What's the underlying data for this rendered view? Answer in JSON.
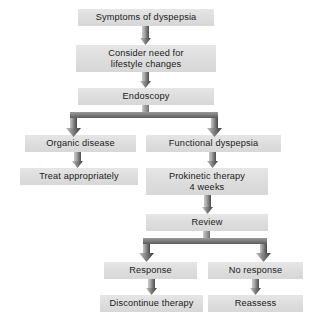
{
  "diagram": {
    "background_color": "#ffffff",
    "node_fill_color": "#dedede",
    "connector_color": "#6e6e6e",
    "text_color": "#1b1b1b",
    "nodes": [
      {
        "id": "symptoms",
        "label": "Symptoms of dyspepsia",
        "x": 78,
        "y": 9,
        "w": 136,
        "h": 17
      },
      {
        "id": "lifestyle",
        "label": "Consider need for\nlifestyle changes",
        "x": 76,
        "y": 45,
        "w": 140,
        "h": 27
      },
      {
        "id": "endoscopy",
        "label": "Endoscopy",
        "x": 78,
        "y": 88,
        "w": 136,
        "h": 17
      },
      {
        "id": "organic",
        "label": "Organic disease",
        "x": 25,
        "y": 135,
        "w": 111,
        "h": 17
      },
      {
        "id": "functional",
        "label": "Functional dyspepsia",
        "x": 146,
        "y": 135,
        "w": 135,
        "h": 17
      },
      {
        "id": "treat",
        "label": "Treat appropriately",
        "x": 20,
        "y": 168,
        "w": 118,
        "h": 17
      },
      {
        "id": "prokinetic",
        "label": "Prokinetic therapy\n4 weeks",
        "x": 146,
        "y": 168,
        "w": 122,
        "h": 27
      },
      {
        "id": "review",
        "label": "Review",
        "x": 146,
        "y": 214,
        "w": 122,
        "h": 17
      },
      {
        "id": "response",
        "label": "Response",
        "x": 104,
        "y": 262,
        "w": 93,
        "h": 17
      },
      {
        "id": "noresponse",
        "label": "No response",
        "x": 208,
        "y": 262,
        "w": 95,
        "h": 17
      },
      {
        "id": "discontinue",
        "label": "Discontinue therapy",
        "x": 100,
        "y": 295,
        "w": 103,
        "h": 17
      },
      {
        "id": "reassess",
        "label": "Reassess",
        "x": 208,
        "y": 295,
        "w": 95,
        "h": 17
      }
    ],
    "connectors": [
      {
        "id": "symptoms-to-lifestyle",
        "type": "arrow",
        "from": "symptoms",
        "to": "lifestyle"
      },
      {
        "id": "lifestyle-to-endoscopy",
        "type": "arrow",
        "from": "lifestyle",
        "to": "endoscopy"
      },
      {
        "id": "endoscopy-fork",
        "type": "fork",
        "from": "endoscopy",
        "to": "organic, functional"
      },
      {
        "id": "organic-to-treat",
        "type": "arrow",
        "from": "organic",
        "to": "treat"
      },
      {
        "id": "functional-to-prokinetic",
        "type": "arrow",
        "from": "functional",
        "to": "prokinetic"
      },
      {
        "id": "prokinetic-to-review",
        "type": "arrow",
        "from": "prokinetic",
        "to": "review"
      },
      {
        "id": "review-fork",
        "type": "fork",
        "from": "review",
        "to": "response, noresponse"
      },
      {
        "id": "response-to-discontinue",
        "type": "arrow",
        "from": "response",
        "to": "discontinue"
      },
      {
        "id": "noresponse-to-reassess",
        "type": "arrow",
        "from": "noresponse",
        "to": "reassess"
      }
    ]
  }
}
